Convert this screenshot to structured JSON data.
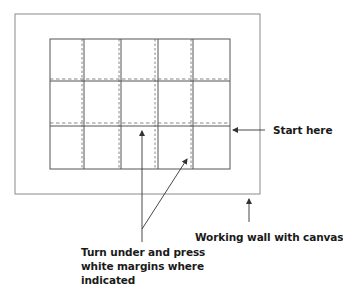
{
  "diagram": {
    "colors": {
      "outer_border": "#8a8a8a",
      "grid_line": "#555555",
      "dashed_line": "#6a6a6a",
      "arrow": "#333333",
      "text": "#1a1a1a",
      "background": "#ffffff"
    },
    "outer_wall": {
      "x": 15,
      "y": 14,
      "width": 245,
      "height": 180
    },
    "canvas_grid": {
      "x": 50,
      "y": 39,
      "width": 180,
      "height": 130,
      "columns": 5,
      "rows": 3,
      "solid_vertical_x": [
        84,
        121,
        158,
        193
      ],
      "solid_horizontal_y": [
        81,
        126
      ],
      "dashed_vertical_x": [
        82,
        119,
        155,
        191
      ],
      "dashed_horizontal_y": [
        79,
        123
      ]
    },
    "arrows": [
      {
        "name": "start-here-arrow",
        "from": [
          265,
          130
        ],
        "to": [
          232,
          130
        ]
      },
      {
        "name": "wall-arrow",
        "from": [
          249,
          222
        ],
        "to": [
          249,
          198
        ]
      },
      {
        "name": "margin-arrow-vertical",
        "from": [
          142,
          242
        ],
        "to": [
          142,
          130
        ]
      },
      {
        "name": "margin-arrow-diagonal",
        "from": [
          142,
          229
        ],
        "to": [
          187,
          158
        ]
      }
    ]
  },
  "labels": {
    "start_here": "Start here",
    "working_wall": "Working wall with canvas",
    "turn_under": {
      "line1": "Turn under and press",
      "line2": "white margins where",
      "line3": "indicated"
    }
  }
}
